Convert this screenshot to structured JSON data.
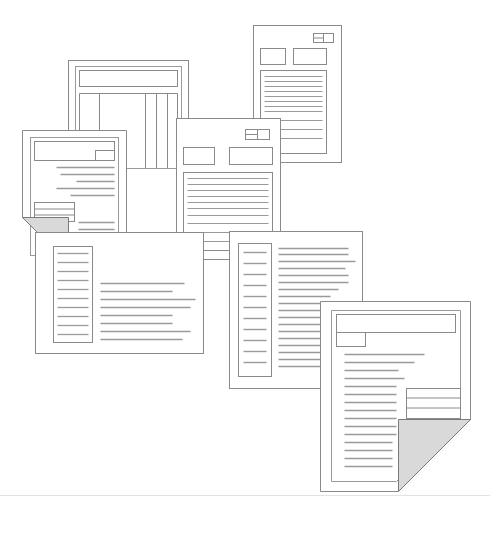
{
  "illustration": {
    "title": "Stack of overlapping document pages",
    "background_color": "#ffffff",
    "stroke_color": "#888888",
    "text_line_color": "#9a9a9a",
    "fold_fill_color": "#d9d9d9",
    "fold_edge_color": "#7a7a7a",
    "ground_line_color": "#e2e2e2",
    "canvas": {
      "width": 490,
      "height": 540
    }
  },
  "ground_line": {
    "label": "horizon-line",
    "y": 495,
    "x1": 0,
    "x2": 490
  },
  "documents": [
    {
      "id": "doc-table",
      "label": "Table document (top left)",
      "order": 1,
      "x": 68,
      "y": 60,
      "width": 120,
      "height": 195,
      "has_fold": false,
      "features": [
        "outer-frame",
        "inner-frame",
        "header-bar",
        "column-rules"
      ]
    },
    {
      "id": "doc-report-top-right",
      "label": "Report document (top right)",
      "order": 2,
      "x": 253,
      "y": 25,
      "width": 88,
      "height": 136,
      "has_fold": false,
      "features": [
        "badge",
        "two-header-boxes",
        "body-text-box"
      ]
    },
    {
      "id": "doc-folded-left",
      "label": "Folded letter (left)",
      "order": 3,
      "x": 22,
      "y": 130,
      "width": 104,
      "height": 134,
      "has_fold": true,
      "fold_corner": "bottom-left",
      "fold_size": 46,
      "features": [
        "header-bar",
        "notch-box",
        "text-lines",
        "inset-box"
      ]
    },
    {
      "id": "doc-center",
      "label": "Center document",
      "order": 4,
      "x": 176,
      "y": 118,
      "width": 104,
      "height": 140,
      "has_fold": false,
      "features": [
        "badge",
        "two-header-boxes",
        "body-text-box"
      ]
    },
    {
      "id": "doc-two-column-left",
      "label": "Two column article (bottom left)",
      "order": 5,
      "x": 35,
      "y": 232,
      "width": 168,
      "height": 120,
      "has_fold": false,
      "features": [
        "narrow-left-column",
        "wide-right-column"
      ]
    },
    {
      "id": "doc-two-column-right",
      "label": "Two column article (right)",
      "order": 6,
      "x": 229,
      "y": 231,
      "width": 133,
      "height": 157,
      "has_fold": false,
      "features": [
        "boxed-left-column",
        "right-text-column"
      ]
    },
    {
      "id": "doc-folded-bottom-right",
      "label": "Folded page (bottom right)",
      "order": 7,
      "x": 320,
      "y": 301,
      "width": 150,
      "height": 190,
      "has_fold": true,
      "fold_corner": "bottom-right",
      "fold_size": 72,
      "features": [
        "header-bar",
        "sub-box",
        "text-lines",
        "inset-table"
      ]
    }
  ],
  "counts": {
    "documents": 7,
    "folded_pages": 2
  }
}
